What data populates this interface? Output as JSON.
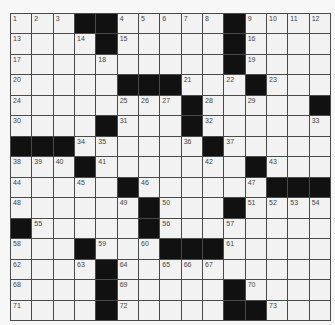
{
  "puzzle": {
    "rows": 15,
    "cols": 15,
    "colors": {
      "cell": "#f2f2f2",
      "block": "#111111",
      "line": "#4a4a4a",
      "number": "#444444"
    },
    "grid": [
      [
        "1",
        "2",
        "3",
        "#",
        "#",
        "4",
        "5",
        "6",
        "7",
        "8",
        "#",
        "9",
        "10",
        "11",
        "12"
      ],
      [
        "13",
        "",
        "",
        "14",
        "#",
        "15",
        "",
        "",
        "",
        "",
        "#",
        "16",
        "",
        "",
        ""
      ],
      [
        "17",
        "",
        "",
        "",
        "18",
        "",
        "",
        "",
        "",
        "",
        "#",
        "19",
        "",
        "",
        ""
      ],
      [
        "20",
        "",
        "",
        "",
        "",
        "#",
        "#",
        "#",
        "21",
        "",
        "22",
        "#",
        "23",
        "",
        ""
      ],
      [
        "24",
        "",
        "",
        "",
        "",
        "25",
        "26",
        "27",
        "#",
        "28",
        "",
        "29",
        "",
        "",
        "#"
      ],
      [
        "30",
        "",
        "",
        "",
        "#",
        "31",
        "",
        "",
        "#",
        "32",
        "",
        "",
        "",
        "",
        "33"
      ],
      [
        "#",
        "#",
        "#",
        "34",
        "35",
        "",
        "",
        "",
        "36",
        "#",
        "37",
        "",
        "",
        "",
        ""
      ],
      [
        "38",
        "39",
        "40",
        "#",
        "41",
        "",
        "",
        "",
        "",
        "42",
        "",
        "#",
        "43",
        "",
        ""
      ],
      [
        "44",
        "",
        "",
        "45",
        "",
        "#",
        "46",
        "",
        "",
        "",
        "",
        "47",
        "#",
        "#",
        "#"
      ],
      [
        "48",
        "",
        "",
        "",
        "",
        "49",
        "#",
        "50",
        "",
        "",
        "#",
        "51",
        "52",
        "53",
        "54"
      ],
      [
        "#",
        "55",
        "",
        "",
        "",
        "",
        "#",
        "56",
        "",
        "",
        "57",
        "",
        "",
        "",
        ""
      ],
      [
        "58",
        "",
        "",
        "#",
        "59",
        "",
        "60",
        "#",
        "#",
        "#",
        "61",
        "",
        "",
        "",
        ""
      ],
      [
        "62",
        "",
        "",
        "63",
        "#",
        "64",
        "",
        "65",
        "66",
        "67",
        "",
        "",
        "",
        "",
        ""
      ],
      [
        "68",
        "",
        "",
        "",
        "#",
        "69",
        "",
        "",
        "",
        "",
        "#",
        "70",
        "",
        "",
        ""
      ],
      [
        "71",
        "",
        "",
        "",
        "#",
        "72",
        "",
        "",
        "",
        "",
        "#",
        "#",
        "73",
        "",
        ""
      ]
    ]
  }
}
